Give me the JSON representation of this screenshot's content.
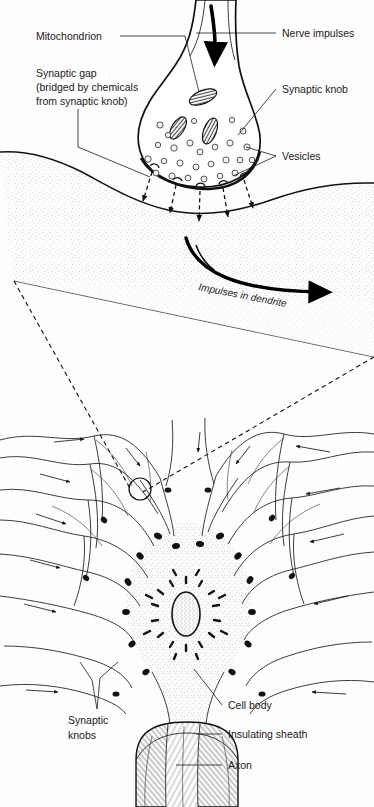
{
  "figure": {
    "type": "biological-diagram",
    "background_color": "#fdfdfd",
    "ink_color": "#111111"
  },
  "labels": {
    "mitochondrion": "Mitochondrion",
    "synaptic_gap_line1": "Synaptic gap",
    "synaptic_gap_line2": "(bridged by chemicals",
    "synaptic_gap_line3": "from synaptic knob)",
    "nerve_impulses": "Nerve impulses",
    "synaptic_knob": "Synaptic knob",
    "vesicles": "Vesicles",
    "impulses_in_dendrite": "Impulses in dendrite",
    "synaptic_knobs_line1": "Synaptic",
    "synaptic_knobs_line2": "knobs",
    "cell_body": "Cell body",
    "insulating_sheath": "Insulating sheath",
    "axon": "Axon"
  },
  "panels": {
    "top": {
      "name": "magnified-synapse",
      "description": "Enlarged view of a synaptic knob contacting a dendrite membrane",
      "vesicle_count": 26,
      "mitochondria_count": 3,
      "transmitter_arrow_count": 5
    },
    "bottom": {
      "name": "whole-neuron",
      "description": "Nerve cell body with many dendrites, synaptic knobs, nucleus and myelinated axon",
      "dendrite_arrow_count": 14
    }
  }
}
